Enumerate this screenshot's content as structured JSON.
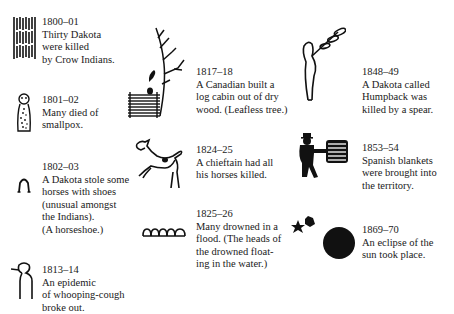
{
  "figure": {
    "entries": [
      {
        "id": "e1800",
        "year": "1800–01",
        "lines": [
          "Thirty Dakota",
          "were killed",
          "by Crow Indians."
        ],
        "icon": "tally-marks-icon"
      },
      {
        "id": "e1801",
        "year": "1801–02",
        "lines": [
          "Many died of",
          "smallpox."
        ],
        "icon": "smallpox-figure-icon"
      },
      {
        "id": "e1802",
        "year": "1802–03",
        "lines": [
          "A Dakota stole some",
          "horses with shoes",
          "(unusual amongst",
          "the Indians).",
          "(A horseshoe.)"
        ],
        "icon": "horseshoe-icon"
      },
      {
        "id": "e1813",
        "year": "1813–14",
        "lines": [
          "An epidemic",
          "of whooping-cough",
          "broke out."
        ],
        "icon": "coughing-figure-icon"
      },
      {
        "id": "e1817",
        "year": "1817–18",
        "lines": [
          "A Canadian built a",
          "log cabin out of dry",
          "wood. (Leafless tree.)"
        ],
        "icon": "log-cabin-tree-icon"
      },
      {
        "id": "e1824",
        "year": "1824–25",
        "lines": [
          "A chieftain had all",
          "his horses killed."
        ],
        "icon": "horse-icon"
      },
      {
        "id": "e1825",
        "year": "1825–26",
        "lines": [
          "Many drowned in a",
          "flood. (The heads of",
          "the drowned float-",
          "ing in the water.)"
        ],
        "icon": "floating-heads-icon"
      },
      {
        "id": "e1848",
        "year": "1848–49",
        "lines": [
          "A Dakota called",
          "Humpback was",
          "killed by a spear."
        ],
        "icon": "humpback-spear-icon"
      },
      {
        "id": "e1853",
        "year": "1853–54",
        "lines": [
          "Spanish blankets",
          "were brought into",
          "the territory."
        ],
        "icon": "man-with-blanket-icon"
      },
      {
        "id": "e1869",
        "year": "1869–70",
        "lines": [
          "An eclipse of the",
          "sun took place."
        ],
        "icon": "eclipse-stars-icon"
      }
    ]
  },
  "colors": {
    "ink": "#111111",
    "paper": "#ffffff"
  }
}
